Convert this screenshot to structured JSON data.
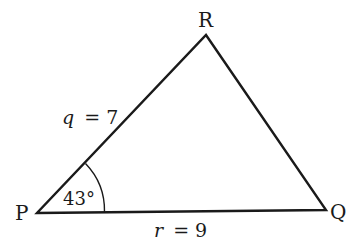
{
  "diagram": {
    "type": "triangle",
    "vertices": [
      {
        "label": "P",
        "x": 37,
        "y": 213
      },
      {
        "label": "Q",
        "x": 326,
        "y": 210
      },
      {
        "label": "R",
        "x": 206,
        "y": 35
      }
    ],
    "sides": [
      {
        "label_var": "q",
        "label_eq": "= 7",
        "value": 7,
        "between": "P-R"
      },
      {
        "label_var": "r",
        "label_eq": "= 9",
        "value": 9,
        "between": "P-Q"
      }
    ],
    "angles": [
      {
        "at": "P",
        "label": "43°",
        "value": 43
      }
    ],
    "colors": {
      "stroke": "#1a1a1a",
      "background": "#ffffff"
    }
  }
}
